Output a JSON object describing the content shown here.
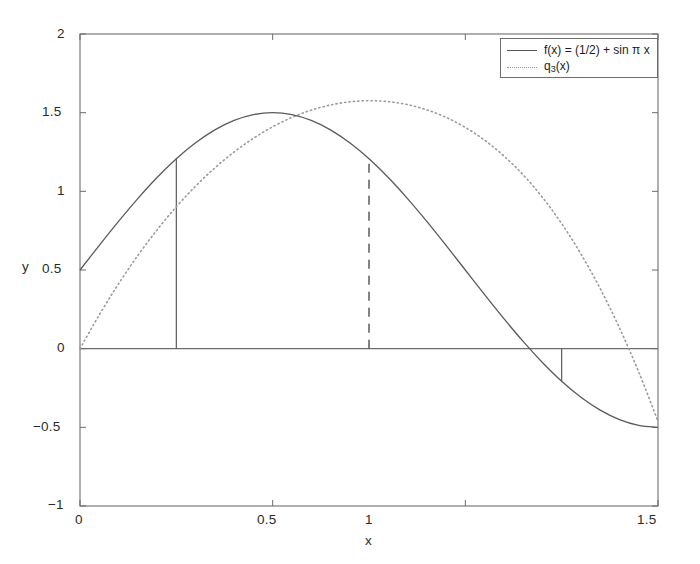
{
  "chart_data": {
    "type": "line",
    "title": "",
    "xlabel": "x",
    "ylabel": "y",
    "xlim": [
      0,
      1.5
    ],
    "ylim": [
      -1,
      2
    ],
    "grid": false,
    "legend_position": "top-right",
    "xticks": [
      "0",
      "0.5",
      "1",
      "1.5"
    ],
    "xtick_values": [
      0,
      0.5,
      1,
      1.5
    ],
    "yticks": [
      "-1",
      "-0.5",
      "0",
      "0.5",
      "1",
      "1.5",
      "2"
    ],
    "ytick_values": [
      -1,
      -0.5,
      0,
      0.5,
      1,
      1.5,
      2
    ],
    "series": [
      {
        "name": "f(x) = (1/2) + sin π x",
        "style": "solid",
        "color": "#5a5a5a",
        "x": [
          0,
          0.05,
          0.1,
          0.15,
          0.2,
          0.25,
          0.3,
          0.35,
          0.4,
          0.45,
          0.5,
          0.55,
          0.6,
          0.65,
          0.7,
          0.75,
          0.8,
          0.85,
          0.9,
          0.95,
          1.0,
          1.05,
          1.1,
          1.15,
          1.2,
          1.25,
          1.3,
          1.35,
          1.4,
          1.45,
          1.5
        ],
        "values": [
          0.5,
          0.6564,
          0.809,
          0.954,
          1.0878,
          1.2071,
          1.309,
          1.391,
          1.4511,
          1.4877,
          1.5,
          1.4877,
          1.4511,
          1.391,
          1.309,
          1.2071,
          1.0878,
          0.954,
          0.809,
          0.6564,
          0.5,
          0.3436,
          0.191,
          0.046,
          -0.0878,
          -0.2071,
          -0.309,
          -0.391,
          -0.4511,
          -0.4877,
          -0.5
        ]
      },
      {
        "name": "q_3(x)",
        "label_base": "q",
        "label_sub": "3",
        "label_tail": "(x)",
        "style": "dotted",
        "color": "#9a9a9a",
        "x": [
          0,
          0.05,
          0.1,
          0.15,
          0.2,
          0.25,
          0.3,
          0.35,
          0.4,
          0.45,
          0.5,
          0.55,
          0.6,
          0.65,
          0.7,
          0.75,
          0.8,
          0.85,
          0.9,
          0.95,
          1.0,
          1.05,
          1.1,
          1.15,
          1.2,
          1.25,
          1.3,
          1.35,
          1.4,
          1.45,
          1.5
        ],
        "values": [
          0.0,
          0.215,
          0.412,
          0.592,
          0.755,
          0.902,
          1.033,
          1.149,
          1.25,
          1.337,
          1.41,
          1.47,
          1.516,
          1.549,
          1.569,
          1.576,
          1.57,
          1.551,
          1.518,
          1.47,
          1.406,
          1.325,
          1.225,
          1.105,
          0.962,
          0.795,
          0.602,
          0.382,
          0.132,
          -0.148,
          -0.462
        ]
      }
    ],
    "markers": [
      {
        "name": "solid-marker-left",
        "x": 0.25,
        "y_bottom": 0,
        "y_top": 1.2071,
        "style": "solid"
      },
      {
        "name": "dashed-marker-mid",
        "x": 0.75,
        "y_bottom": 0,
        "y_top": 1.2071,
        "style": "dashed"
      },
      {
        "name": "solid-marker-right",
        "x": 1.25,
        "y_bottom": -0.2071,
        "y_top": 0,
        "style": "solid"
      }
    ]
  },
  "legend": {
    "entry_1": "f(x) = (1/2) + sin π x",
    "entry_2_base": "q",
    "entry_2_sub": "3",
    "entry_2_tail": "(x)"
  },
  "axes": {
    "x_title": "x",
    "y_title": "y",
    "x_tick_0": "0",
    "x_tick_1": "0.5",
    "x_tick_2": "1",
    "x_tick_3": "1.5",
    "y_tick_0": "2",
    "y_tick_1": "1.5",
    "y_tick_2": "1",
    "y_tick_3": "0.5",
    "y_tick_4": "0",
    "y_tick_5": "−0.5",
    "y_tick_6": "−1"
  },
  "colors": {
    "axis": "#6d6d6d",
    "curve_solid": "#5a5a5a",
    "curve_dotted": "#9a9a9a",
    "text": "#2b2b2b",
    "background": "#ffffff"
  }
}
